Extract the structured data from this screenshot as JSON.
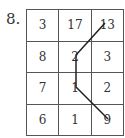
{
  "problem": {
    "number": "8.",
    "grid": [
      [
        "3",
        "17",
        "13"
      ],
      [
        "8",
        "2",
        "3"
      ],
      [
        "7",
        "1",
        "2"
      ],
      [
        "6",
        "1",
        "9"
      ]
    ],
    "path_points": [
      [
        105,
        23
      ],
      [
        76,
        55
      ],
      [
        76,
        87
      ],
      [
        108,
        119
      ]
    ],
    "line_color": "#222222"
  }
}
